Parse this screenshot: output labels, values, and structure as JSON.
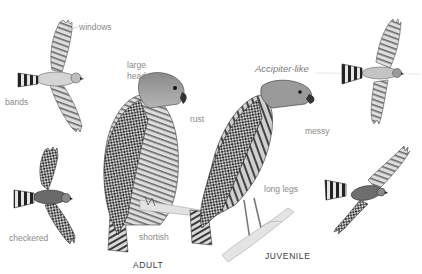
{
  "figure": {
    "colors": {
      "background": "#ffffff",
      "label_text": "#8a8a8a",
      "caption_text": "#3a3a3a",
      "ink_dark": "#2b2b2b",
      "ink_mid": "#6e6e6e",
      "ink_light": "#bdbdbd"
    },
    "annotations": {
      "windows": "windows",
      "bands": "bands",
      "checkered": "checkered",
      "large_head": [
        "large",
        "head"
      ],
      "rust": "rust",
      "shortish": "shortish",
      "accipiter_like": "Accipiter-like",
      "messy": "messy",
      "long_legs": "long legs"
    },
    "captions": {
      "adult": "ADULT",
      "juvenile": "JUVENILE"
    }
  }
}
